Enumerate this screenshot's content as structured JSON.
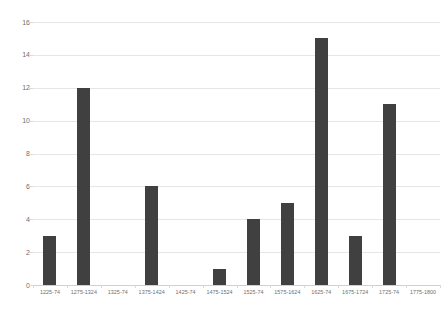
{
  "chart_data": {
    "type": "bar",
    "title": "",
    "subtitle": "",
    "xlabel": "",
    "ylabel": "",
    "categories": [
      "1225-74",
      "1275-1324",
      "1325-74",
      "1375-1424",
      "1425-74",
      "1475-1524",
      "1525-74",
      "1575-1624",
      "1625-74",
      "1675-1724",
      "1725-74",
      "1775-1800"
    ],
    "values": [
      3,
      12,
      0,
      6,
      0,
      1,
      4,
      5,
      15,
      3,
      11,
      0
    ],
    "ylim": [
      0,
      16
    ],
    "y_ticks": [
      0,
      2,
      4,
      6,
      8,
      10,
      12,
      14,
      16
    ],
    "y_tick_labels": [
      "0",
      "2",
      "4",
      "6",
      "8",
      "10",
      "12",
      "14",
      "16"
    ],
    "grid": true,
    "legend": false,
    "legend_position": "none",
    "bar_color": "#404040",
    "gridline_color": "#e6e6e6",
    "axis_text_color": "#6e6e6e",
    "background_color": "#ffffff"
  }
}
